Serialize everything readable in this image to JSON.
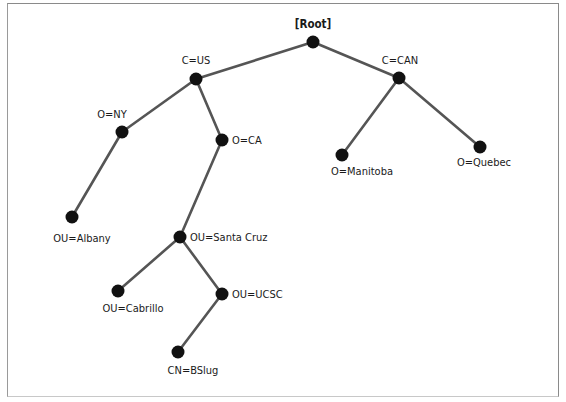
{
  "diagram": {
    "type": "directory-tree",
    "nodes": [
      {
        "id": "root",
        "label": "[Root]",
        "parent": null
      },
      {
        "id": "c_us",
        "label": "C=US",
        "parent": "root"
      },
      {
        "id": "c_can",
        "label": "C=CAN",
        "parent": "root"
      },
      {
        "id": "o_ny",
        "label": "O=NY",
        "parent": "c_us"
      },
      {
        "id": "o_ca",
        "label": "O=CA",
        "parent": "c_us"
      },
      {
        "id": "o_manitoba",
        "label": "O=Manitoba",
        "parent": "c_can"
      },
      {
        "id": "o_quebec",
        "label": "O=Quebec",
        "parent": "c_can"
      },
      {
        "id": "ou_albany",
        "label": "OU=Albany",
        "parent": "o_ny"
      },
      {
        "id": "ou_santacruz",
        "label": "OU=Santa Cruz",
        "parent": "o_ca"
      },
      {
        "id": "ou_cabrillo",
        "label": "OU=Cabrillo",
        "parent": "ou_santacruz"
      },
      {
        "id": "ou_ucsc",
        "label": "OU=UCSC",
        "parent": "ou_santacruz"
      },
      {
        "id": "cn_bslug",
        "label": "CN=BSlug",
        "parent": "ou_ucsc"
      }
    ]
  }
}
